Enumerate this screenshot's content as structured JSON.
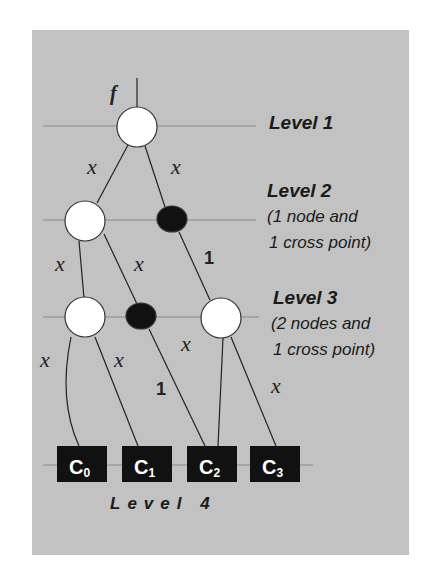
{
  "diagram": {
    "input_label": "f",
    "levels": [
      {
        "label": "Level 1"
      },
      {
        "label": "Level 2",
        "note_line1": "(1 node and",
        "note_line2": "1 cross point)"
      },
      {
        "label": "Level 3",
        "note_line1": "(2 nodes and",
        "note_line2": "1 cross point)"
      },
      {
        "label": "Level 4"
      }
    ],
    "edge_labels": {
      "l1_left": "x",
      "l1_right": "x",
      "l2_left": "x",
      "l2_mid": "x",
      "l2_cross": "1",
      "l3_left": "x",
      "l3_mid": "x",
      "l3_right_in": "x",
      "l3_cross": "1",
      "l3_right_out": "x"
    },
    "outputs": [
      {
        "base": "C",
        "sub": "0"
      },
      {
        "base": "C",
        "sub": "1"
      },
      {
        "base": "C",
        "sub": "2"
      },
      {
        "base": "C",
        "sub": "3"
      }
    ],
    "colors": {
      "background": "#c2c2c2",
      "node_fill": "#ffffff",
      "cross_point_fill": "#111111",
      "output_box_fill": "#111111",
      "level_line": "#8a8a8a",
      "edge": "#222222"
    }
  }
}
